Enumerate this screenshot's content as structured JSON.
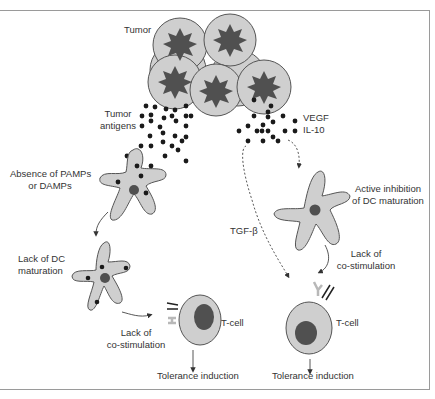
{
  "labels": {
    "tumor": "Tumor",
    "tumor_antigens_1": "Tumor",
    "tumor_antigens_2": "antigens",
    "vegf": "VEGF",
    "il10": "IL-10",
    "absence_1": "Absence of PAMPs",
    "absence_2": "or DAMPs",
    "lack_dc_1": "Lack of DC",
    "lack_dc_2": "maturation",
    "lack_costim_left_1": "Lack of",
    "lack_costim_left_2": "co-stimulation",
    "tcell_left": "T-cell",
    "tolerance_left": "Tolerance induction",
    "tgf": "TGF-β",
    "active_inhib_1": "Active inhibition",
    "active_inhib_2": "of DC maturation",
    "lack_costim_right_1": "Lack of",
    "lack_costim_right_2": "co-stimulation",
    "tcell_right": "T-cell",
    "tolerance_right": "Tolerance induction"
  },
  "colors": {
    "cell_fill": "#cfcfcf",
    "nucleus_dark": "#555555",
    "outline": "#555555",
    "dots": "#1a1a1a",
    "frame": "#9a9a9a"
  }
}
